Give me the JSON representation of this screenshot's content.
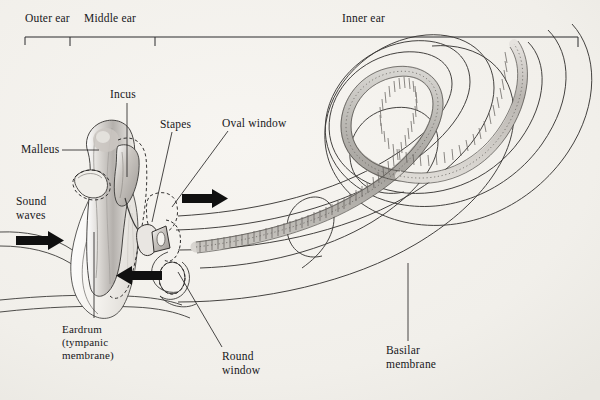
{
  "figure": {
    "background_color": "#f2f0eb",
    "ink_color": "#17171a"
  },
  "scale_bar": {
    "name": "ear-regions-scale",
    "regions": [
      {
        "id": "outer",
        "label": "Outer ear"
      },
      {
        "id": "middle",
        "label": "Middle ear"
      },
      {
        "id": "inner",
        "label": "Inner ear"
      }
    ]
  },
  "labels": {
    "incus": "Incus",
    "malleus": "Malleus",
    "stapes": "Stapes",
    "oval_window": "Oval window",
    "sound_waves_line1": "Sound",
    "sound_waves_line2": "waves",
    "eardrum_line1": "Eardrum",
    "eardrum_line2": "(tympanic",
    "eardrum_line3": "membrane)",
    "round_window_line1": "Round",
    "round_window_line2": "window",
    "basilar_line1": "Basilar",
    "basilar_line2": "membrane"
  },
  "arrows": [
    {
      "id": "sound-waves-arrow",
      "direction": "right"
    },
    {
      "id": "oval-window-arrow",
      "direction": "right"
    },
    {
      "id": "round-window-arrow",
      "direction": "left"
    }
  ]
}
